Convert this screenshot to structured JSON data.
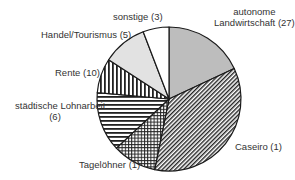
{
  "chart_data": {
    "type": "pie",
    "title": "",
    "center": [
      169,
      99
    ],
    "radius": 72,
    "start_angle_deg": 0,
    "direction": "clockwise",
    "slices": [
      {
        "label": "autonome Landwirtschaft (27)",
        "name": "autonome Landwirtschaft",
        "value": 27,
        "start": 0,
        "end": 65,
        "fill": "#bdbdbd",
        "pattern": "solid"
      },
      {
        "label": "Caseiro (1)",
        "name": "Caseiro",
        "value": 1,
        "start": 65,
        "end": 191.5,
        "fill": "#ffffff",
        "pattern": "diagonal"
      },
      {
        "label": "Tagelöhner (1)",
        "name": "Tagelöhner",
        "value": 1,
        "start": 191.5,
        "end": 227,
        "fill": "#ffffff",
        "pattern": "grid"
      },
      {
        "label": "städtische Lohnarbeit (6)",
        "name": "städtische Lohnarbeit",
        "value": 6,
        "start": 227,
        "end": 275,
        "fill": "#ffffff",
        "pattern": "horizontal"
      },
      {
        "label": "Rente (10)",
        "name": "Rente",
        "value": 10,
        "start": 275,
        "end": 303,
        "fill": "#ffffff",
        "pattern": "vertical"
      },
      {
        "label": "Handel/Tourismus (5)",
        "name": "Handel/Tourismus",
        "value": 5,
        "start": 303,
        "end": 339,
        "fill": "#e2e2e2",
        "pattern": "solid"
      },
      {
        "label": "sonstige (3)",
        "name": "sonstige",
        "value": 3,
        "start": 339,
        "end": 360,
        "fill": "#ffffff",
        "pattern": "solid"
      }
    ],
    "legend": "none (direct labels)"
  },
  "labels": {
    "landwirtschaft_line1": "autonome",
    "landwirtschaft_line2": "Landwirtschaft (27)",
    "caseiro": "Caseiro (1)",
    "tageloehner": "Tagelöhner (1)",
    "lohnarbeit_line1": "städtische Lohnarbeit",
    "lohnarbeit_line2": "(6)",
    "rente": "Rente (10)",
    "handel": "Handel/Tourismus (5)",
    "sonstige": "sonstige (3)"
  }
}
